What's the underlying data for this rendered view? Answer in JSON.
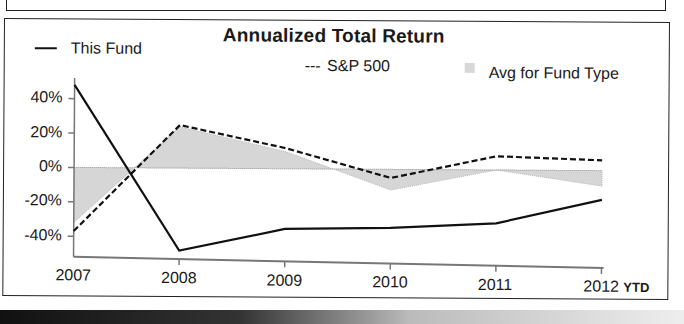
{
  "chart_data": {
    "type": "line",
    "title": "Annualized Total Return",
    "xlabel": "",
    "ylabel": "",
    "categories": [
      "2007",
      "2008",
      "2009",
      "2010",
      "2011",
      "2012"
    ],
    "x_suffix_label": "YTD",
    "y_ticks": [
      "40%",
      "20%",
      "0%",
      "-20%",
      "-40%"
    ],
    "ylim": [
      -50,
      50
    ],
    "grid": false,
    "legend_position": "top",
    "series": [
      {
        "name": "This Fund",
        "style": "solid",
        "values": [
          48,
          -48,
          -35,
          -34,
          -31,
          -17
        ]
      },
      {
        "name": "S&P 500",
        "style": "dashed",
        "values": [
          -37,
          25,
          12,
          -5,
          8,
          6
        ]
      },
      {
        "name": "Avg for Fund Type",
        "style": "area",
        "values": [
          -32,
          24,
          10,
          -12,
          0,
          -9
        ]
      }
    ]
  },
  "legend": {
    "fund_label": "This Fund",
    "sp_label": "S&P 500",
    "sp_prefix": "---",
    "avg_label": "Avg for Fund Type"
  },
  "colors": {
    "line": "#111111",
    "area": "#d6d6d6",
    "axis": "#777777"
  }
}
